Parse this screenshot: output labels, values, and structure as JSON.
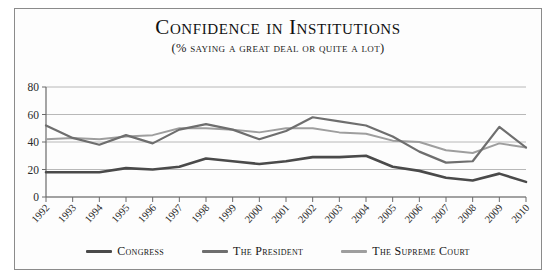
{
  "chart_data": {
    "type": "line",
    "title": "Confidence in Institutions",
    "subtitle": "(% saying a great deal or quite a lot)",
    "xlabel": "",
    "ylabel": "",
    "ylim": [
      0,
      80
    ],
    "yticks": [
      0,
      20,
      40,
      60,
      80
    ],
    "grid": true,
    "legend_position": "bottom",
    "categories": [
      "1992",
      "1993",
      "1994",
      "1995",
      "1996",
      "1997",
      "1998",
      "1999",
      "2000",
      "2001",
      "2002",
      "2003",
      "2004",
      "2005",
      "2006",
      "2007",
      "2008",
      "2009",
      "2010"
    ],
    "series": [
      {
        "name": "Congress",
        "color": "#4a4a4a",
        "values": [
          18,
          18,
          18,
          21,
          20,
          22,
          28,
          26,
          24,
          26,
          29,
          29,
          30,
          22,
          19,
          14,
          12,
          17,
          11
        ]
      },
      {
        "name": "The President",
        "color": "#6e6e6e",
        "values": [
          52,
          43,
          38,
          45,
          39,
          49,
          53,
          49,
          42,
          48,
          58,
          55,
          52,
          44,
          33,
          25,
          26,
          51,
          36
        ]
      },
      {
        "name": "The Supreme Court",
        "color": "#9e9e9e",
        "values": [
          42,
          43,
          42,
          44,
          45,
          50,
          50,
          49,
          47,
          50,
          50,
          47,
          46,
          41,
          40,
          34,
          32,
          39,
          36
        ]
      }
    ]
  },
  "legend": {
    "items": [
      {
        "label": "Congress",
        "color": "#4a4a4a"
      },
      {
        "label": "The President",
        "color": "#6e6e6e"
      },
      {
        "label": "The Supreme Court",
        "color": "#9e9e9e"
      }
    ]
  },
  "axes": {
    "y_tick_labels": [
      "80",
      "60",
      "40",
      "20",
      "0"
    ],
    "x_tick_labels": [
      "1992",
      "1993",
      "1994",
      "1995",
      "1996",
      "1997",
      "1998",
      "1999",
      "2000",
      "2001",
      "2002",
      "2003",
      "2004",
      "2005",
      "2006",
      "2007",
      "2008",
      "2009",
      "2010"
    ]
  }
}
